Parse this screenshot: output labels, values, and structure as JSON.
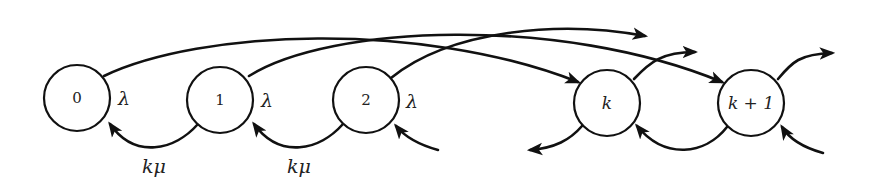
{
  "diagram": {
    "type": "markov-chain-state-transition",
    "colors": {
      "stroke": "#111111",
      "background": "#ffffff",
      "text": "#222222"
    },
    "nodes": [
      {
        "id": "0",
        "label": "0",
        "cx": 77,
        "cy": 98,
        "r": 33,
        "italic": false
      },
      {
        "id": "1",
        "label": "1",
        "cx": 220,
        "cy": 100,
        "r": 33,
        "italic": false
      },
      {
        "id": "2",
        "label": "2",
        "cx": 366,
        "cy": 100,
        "r": 33,
        "italic": false
      },
      {
        "id": "k",
        "label": "k",
        "cx": 607,
        "cy": 103,
        "r": 33,
        "italic": true
      },
      {
        "id": "k+1",
        "label": "k + 1",
        "cx": 751,
        "cy": 103,
        "r": 33,
        "italic": true
      }
    ],
    "rate_labels": [
      {
        "id": "lambda-0",
        "text": "λ",
        "x": 118,
        "y": 98
      },
      {
        "id": "lambda-1",
        "text": "λ",
        "x": 261,
        "y": 100
      },
      {
        "id": "lambda-2",
        "text": "λ",
        "x": 406,
        "y": 101
      },
      {
        "id": "kmu-0",
        "text": "kμ",
        "x": 142,
        "y": 166
      },
      {
        "id": "kmu-1",
        "text": "kμ",
        "x": 287,
        "y": 166
      }
    ],
    "edges": [
      {
        "id": "0-to-k",
        "from": "0",
        "to": "k",
        "label": "λ",
        "d": "M 104 76 C 200 30, 420 20, 578 82"
      },
      {
        "id": "1-to-k+1",
        "from": "1",
        "to": "k+1",
        "label": "λ",
        "d": "M 249 76 C 330 25, 560 15, 722 82"
      },
      {
        "id": "2-to-out",
        "from": "2",
        "to": "k+2",
        "label": "λ",
        "d": "M 391 78 C 450 30, 560 20, 645 36"
      },
      {
        "id": "k-to-out",
        "from": "k",
        "to": "2k",
        "label": "λ",
        "d": "M 634 79 C 650 62, 662 52, 695 52"
      },
      {
        "id": "k+1-to-out",
        "from": "k+1",
        "to": "2k+1",
        "label": "λ",
        "d": "M 778 79 C 792 62, 800 54, 832 53"
      },
      {
        "id": "1-to-0",
        "from": "1",
        "to": "0",
        "label": "kμ",
        "d": "M 198 124 C 175 150, 135 160, 110 124"
      },
      {
        "id": "2-to-1",
        "from": "2",
        "to": "1",
        "label": "kμ",
        "d": "M 343 124 C 320 150, 280 160, 254 124"
      },
      {
        "id": "in-to-2",
        "from": "3",
        "to": "2",
        "label": "",
        "d": "M 438 150 C 420 145, 405 137, 396 126"
      },
      {
        "id": "k-to-in",
        "from": "k",
        "to": "k-1",
        "label": "",
        "d": "M 582 126 C 570 140, 555 148, 530 150"
      },
      {
        "id": "k+1-to-k",
        "from": "k+1",
        "to": "k",
        "label": "",
        "d": "M 727 127 C 705 155, 665 160, 637 126"
      },
      {
        "id": "in-to-k+1",
        "from": "k+2",
        "to": "k+1",
        "label": "",
        "d": "M 823 153 C 805 148, 790 140, 782 127"
      }
    ]
  }
}
